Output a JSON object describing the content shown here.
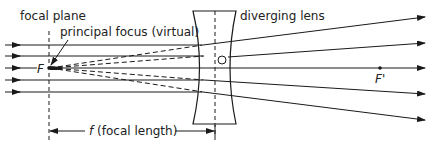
{
  "labels": {
    "focal_plane": "focal plane",
    "principal_focus": "principal focus (virtual)",
    "diverging_lens": "diverging lens",
    "focal_point": "F",
    "second_focal_point": "F'",
    "focal_length_symbol": "f",
    "focal_length_text": "(focal length)"
  },
  "colors": {
    "line": "#1a1a1a",
    "background": "#ffffff"
  },
  "geometry": {
    "focal_plane_x": 49,
    "lens_axis_x": 215,
    "optical_axis_y": 68,
    "incident_rays_y": [
      45,
      56,
      68,
      80,
      92
    ],
    "outgoing_rays_end_y": [
      17,
      43,
      68,
      94,
      120
    ]
  }
}
